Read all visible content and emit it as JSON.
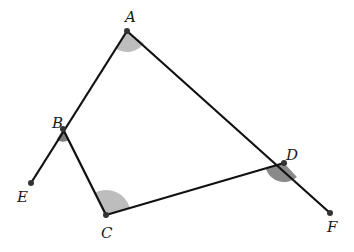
{
  "diagram": {
    "type": "geometry",
    "colors": {
      "line": "#111111",
      "point": "#333333",
      "arc": "#b8b8b8",
      "arc_dark": "#7a7a7a"
    },
    "points": [
      {
        "id": "A",
        "label": "A",
        "x": 127,
        "y": 31,
        "lx": 125,
        "ly": 22
      },
      {
        "id": "B",
        "label": "B",
        "x": 63,
        "y": 129,
        "lx": 52,
        "ly": 128
      },
      {
        "id": "C",
        "label": "C",
        "x": 106,
        "y": 215,
        "lx": 101,
        "ly": 238
      },
      {
        "id": "D",
        "label": "D",
        "x": 284,
        "y": 163,
        "lx": 286,
        "ly": 160
      },
      {
        "id": "E",
        "label": "E",
        "x": 31,
        "y": 183,
        "lx": 17,
        "ly": 202
      },
      {
        "id": "F",
        "label": "F",
        "x": 330,
        "y": 213,
        "lx": 327,
        "ly": 232
      }
    ],
    "segments": [
      {
        "from": "A",
        "to": "E"
      },
      {
        "from": "A",
        "to": "F"
      },
      {
        "from": "B",
        "to": "C"
      },
      {
        "from": "C",
        "to": "D"
      }
    ],
    "shaded_angles": [
      {
        "vertex": "A",
        "between": [
          "B",
          "D"
        ]
      },
      {
        "vertex": "B",
        "between": [
          "E",
          "C"
        ]
      },
      {
        "vertex": "C",
        "between": [
          "B",
          "D"
        ]
      },
      {
        "vertex": "D",
        "between": [
          "C",
          "F"
        ]
      }
    ]
  }
}
